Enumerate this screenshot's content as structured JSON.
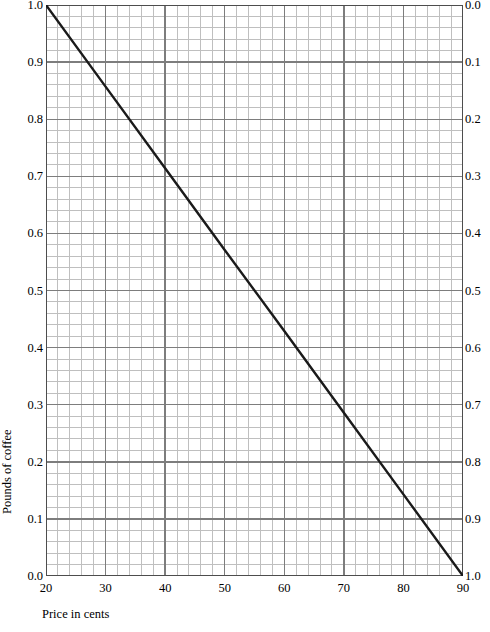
{
  "chart_data": {
    "type": "line",
    "title": "",
    "subtitle": "",
    "xlabel": "Price in cents",
    "ylabel": "Pounds of coffee",
    "ylabel_right": "",
    "xlim": [
      20,
      90
    ],
    "ylim": [
      0.0,
      1.0
    ],
    "ylim_right": [
      1.0,
      0.0
    ],
    "grid": true,
    "grid_minor": true,
    "legend": null,
    "legend_position": "none",
    "xticks": [
      20,
      30,
      40,
      50,
      60,
      70,
      80,
      90
    ],
    "xtick_labels": [
      "20",
      "30",
      "40",
      "50",
      "60",
      "70",
      "80",
      "90"
    ],
    "yticks": [
      0.0,
      0.1,
      0.2,
      0.3,
      0.4,
      0.5,
      0.6,
      0.7,
      0.8,
      0.9,
      1.0
    ],
    "ytick_labels": [
      "0.0",
      "0.1",
      "0.2",
      "0.3",
      "0.4",
      "0.5",
      "0.6",
      "0.7",
      "0.8",
      "0.9",
      "1.0"
    ],
    "ytick_labels_right": [
      "1.0",
      "0.9",
      "0.8",
      "0.7",
      "0.6",
      "0.5",
      "0.4",
      "0.3",
      "0.2",
      "0.1",
      "0.0"
    ],
    "x_minor_per_major": 5,
    "y_minor_per_major": 5,
    "series": [
      {
        "name": "demand",
        "color": "#1a1a1a",
        "x": [
          20,
          30,
          40,
          50,
          60,
          70,
          80,
          90
        ],
        "values": [
          1.0,
          0.857,
          0.714,
          0.571,
          0.429,
          0.286,
          0.143,
          0.0
        ]
      }
    ],
    "annotations": []
  },
  "style": {
    "line_color": "#1a1a1a",
    "grid_major_color": "#7d7d7d",
    "grid_minor_color": "#bfbfbf",
    "axis_color": "#4d4d4d",
    "background": "#ffffff",
    "text_color": "#000000"
  },
  "axis_titles": {
    "x": "Price in cents",
    "y_left": "Pounds of coffee"
  }
}
